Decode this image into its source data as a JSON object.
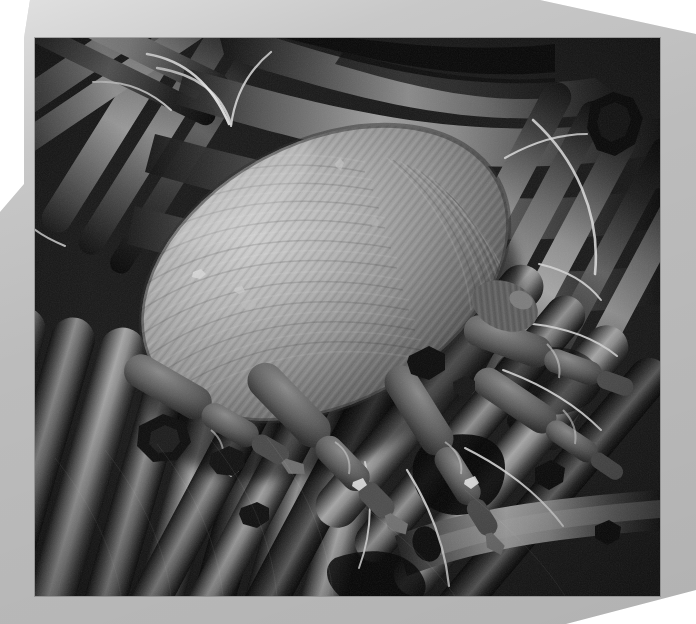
{
  "page": {
    "background_color": "#ffffff",
    "width": 696,
    "height": 624
  },
  "frame": {
    "name": "beveled-photo-mat",
    "color": "#bcbcbc",
    "corner_style": "chamfered",
    "chamfered_corners": [
      "top-left",
      "top-right",
      "left-middle",
      "bottom-right"
    ]
  },
  "photo": {
    "title": "Scanning electron micrograph of a house dust mite on textile fibers",
    "alt_text": "Grayscale SEM image showing a plump oval mite with striated cuticle resting on a bed of woven fabric fibers",
    "color_mode": "grayscale",
    "technique": "scanning electron microscopy",
    "subject": "house dust mite",
    "background_subject": "carpet / textile fibers",
    "bounds": {
      "x": 35,
      "y": 38,
      "width": 625,
      "height": 558
    },
    "border_color": "#787878",
    "tones": {
      "deep_shadow": "#0a0a0a",
      "shadow": "#2e2e2e",
      "midtone": "#6e6e6e",
      "light": "#a8a8a8",
      "highlight": "#d8d8d8",
      "specular": "#f0f0f0"
    },
    "features": [
      {
        "name": "mite-idiosoma",
        "description": "large oval body with fine concentric striations"
      },
      {
        "name": "mite-legs",
        "description": "segmented legs with terminal claws, lower right of body"
      },
      {
        "name": "mite-setae",
        "description": "long curved bristles projecting from the body"
      },
      {
        "name": "fiber-bundle-upper",
        "description": "crossing fibers above and behind the mite"
      },
      {
        "name": "fiber-bundle-lower",
        "description": "dense parallel fibers forming the substrate"
      },
      {
        "name": "debris-particles",
        "description": "dark irregular debris flakes on the fibers"
      }
    ]
  }
}
